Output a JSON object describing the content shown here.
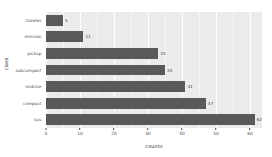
{
  "chart_data": {
    "type": "bar",
    "orientation": "horizontal",
    "title": "",
    "xlabel": "counts",
    "ylabel": "class",
    "categories": [
      "2seater",
      "minivan",
      "pickup",
      "subcompact",
      "midsize",
      "compact",
      "suv"
    ],
    "values": [
      5,
      11,
      33,
      35,
      41,
      47,
      62
    ],
    "value_labels": [
      "5",
      "11",
      "33",
      "35",
      "41",
      "47",
      "62"
    ],
    "xlim": [
      0,
      63.5
    ],
    "ylim": null,
    "xticks": [
      0,
      10,
      20,
      30,
      40,
      50,
      60
    ],
    "xtick_labels": [
      "0",
      "10",
      "20",
      "30",
      "40",
      "50",
      "60"
    ],
    "grid": true,
    "legend": null,
    "colors": {
      "bar": "#595959",
      "panel_background": "#ebebeb",
      "grid_major": "#ffffff",
      "figure_background": "#ffffff",
      "tick_text": "#4d4d4d",
      "axis_title": "#2b2b2b"
    }
  }
}
